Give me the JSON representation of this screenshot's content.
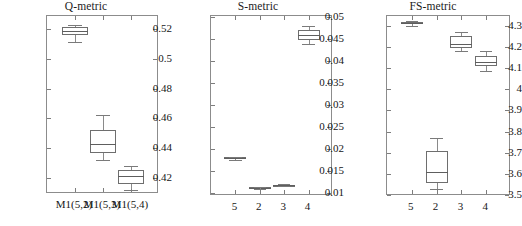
{
  "figure": {
    "background": "#ffffff",
    "line_color": "#6e6e6e",
    "text_color": "#161616"
  },
  "panels": [
    {
      "id": "q-metric",
      "title": "Q-metric",
      "ylim": [
        0.4095,
        0.5285
      ],
      "yticks": [
        0.42,
        0.44,
        0.46,
        0.48,
        0.5,
        0.52
      ],
      "ytick_labels": [
        "0.42",
        "0.44",
        "0.46",
        "0.48",
        "0.5",
        "0.52"
      ],
      "xtick_labels": [
        "M1(5,2)",
        "M1(5,3)",
        "M1(5,4)"
      ]
    },
    {
      "id": "s-metric",
      "title": "S-metric",
      "ylim": [
        0.00935,
        0.0503
      ],
      "yticks": [
        0.01,
        0.015,
        0.02,
        0.025,
        0.03,
        0.035,
        0.04,
        0.045,
        0.05
      ],
      "ytick_labels": [
        "0.01",
        "0.015",
        "0.02",
        "0.025",
        "0.03",
        "0.035",
        "0.04",
        "0.045",
        "0.05"
      ],
      "xtick_labels": [
        "5",
        "2",
        "3",
        "4"
      ]
    },
    {
      "id": "fs-metric",
      "title": "FS-metric",
      "ylim": [
        3.497,
        4.345
      ],
      "yticks": [
        3.5,
        3.6,
        3.7,
        3.8,
        3.9,
        4.0,
        4.1,
        4.2,
        4.3
      ],
      "ytick_labels": [
        "3.5",
        "3.6",
        "3.7",
        "3.8",
        "3.9",
        "4",
        "4.1",
        "4.2",
        "4.3"
      ],
      "xtick_labels": [
        "5",
        "2",
        "3",
        "4"
      ]
    }
  ],
  "chart_data": [
    {
      "type": "box",
      "title": "Q-metric",
      "xlabel": "",
      "ylabel": "",
      "ylim": [
        0.4095,
        0.5285
      ],
      "yticks": [
        0.42,
        0.44,
        0.46,
        0.48,
        0.5,
        0.52
      ],
      "grid": false,
      "legend": "none",
      "categories": [
        "M1(5,2)",
        "M1(5,3)",
        "M1(5,4)"
      ],
      "boxes": [
        {
          "label": "M1(5,2)",
          "whisker_low": 0.5112,
          "q1": 0.5156,
          "median": 0.5182,
          "q3": 0.521,
          "whisker_high": 0.5228
        },
        {
          "label": "M1(5,3)",
          "whisker_low": 0.4325,
          "q1": 0.437,
          "median": 0.443,
          "q3": 0.4525,
          "whisker_high": 0.4625
        },
        {
          "label": "M1(5,4)",
          "whisker_low": 0.4125,
          "q1": 0.4165,
          "median": 0.4215,
          "q3": 0.4255,
          "whisker_high": 0.4285
        }
      ]
    },
    {
      "type": "box",
      "title": "S-metric",
      "xlabel": "",
      "ylabel": "",
      "ylim": [
        0.00935,
        0.0503
      ],
      "yticks": [
        0.01,
        0.015,
        0.02,
        0.025,
        0.03,
        0.035,
        0.04,
        0.045,
        0.05
      ],
      "grid": false,
      "legend": "none",
      "categories": [
        "5",
        "2",
        "3",
        "4"
      ],
      "boxes": [
        {
          "label": "5",
          "whisker_low": 0.01765,
          "q1": 0.01785,
          "median": 0.018,
          "q3": 0.01812,
          "whisker_high": 0.0183
        },
        {
          "label": "2",
          "whisker_low": 0.01105,
          "q1": 0.01118,
          "median": 0.01128,
          "q3": 0.01138,
          "whisker_high": 0.0115
        },
        {
          "label": "3",
          "whisker_low": 0.01155,
          "q1": 0.01168,
          "median": 0.01178,
          "q3": 0.01188,
          "whisker_high": 0.012
        },
        {
          "label": "4",
          "whisker_low": 0.04385,
          "q1": 0.0448,
          "median": 0.046,
          "q3": 0.04715,
          "whisker_high": 0.0481
        }
      ]
    },
    {
      "type": "box",
      "title": "FS-metric",
      "xlabel": "",
      "ylabel": "",
      "ylim": [
        3.497,
        4.345
      ],
      "yticks": [
        3.5,
        3.6,
        3.7,
        3.8,
        3.9,
        4.0,
        4.1,
        4.2,
        4.3
      ],
      "grid": false,
      "legend": "none",
      "categories": [
        "5",
        "2",
        "3",
        "4"
      ],
      "boxes": [
        {
          "label": "5",
          "whisker_low": 4.3,
          "q1": 4.305,
          "median": 4.311,
          "q3": 4.317,
          "whisker_high": 4.322
        },
        {
          "label": "2",
          "whisker_low": 3.528,
          "q1": 3.558,
          "median": 3.611,
          "q3": 3.707,
          "whisker_high": 3.772
        },
        {
          "label": "3",
          "whisker_low": 4.178,
          "q1": 4.192,
          "median": 4.214,
          "q3": 4.252,
          "whisker_high": 4.268
        },
        {
          "label": "4",
          "whisker_low": 4.088,
          "q1": 4.108,
          "median": 4.127,
          "q3": 4.158,
          "whisker_high": 4.182
        }
      ]
    }
  ]
}
